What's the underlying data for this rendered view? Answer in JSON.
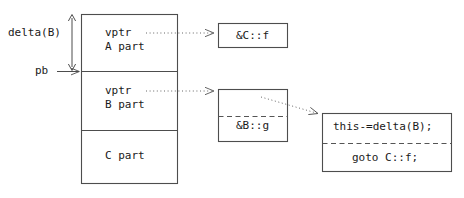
{
  "figure": {
    "type": "object-layout-vtable-diagram",
    "title": "",
    "background": "#ffffff",
    "stroke": "#4d4d4d",
    "text_color": "#1a1a1a"
  },
  "annotations": {
    "delta_label": "delta(B)",
    "pb_label": "pb"
  },
  "object_box": {
    "x": 81,
    "y": 14,
    "width": 97,
    "height": 170,
    "sections": [
      {
        "id": "a-part",
        "vptr_label": "vptr",
        "part_label": "A part",
        "y": 14,
        "height": 57
      },
      {
        "id": "b-part",
        "vptr_label": "vptr",
        "part_label": "B part",
        "y": 71,
        "height": 59
      },
      {
        "id": "c-part",
        "vptr_label": "",
        "part_label": "C part",
        "y": 130,
        "height": 54
      }
    ]
  },
  "vtable_entries": [
    {
      "id": "c-f",
      "label": "&C::f",
      "x": 218,
      "y": 23,
      "width": 70,
      "height": 25
    },
    {
      "id": "b-g",
      "label": "&B::g",
      "x": 218,
      "y": 89,
      "width": 70,
      "height": 53
    }
  ],
  "thunk_box": {
    "x": 322,
    "y": 113,
    "width": 130,
    "height": 59,
    "line1": "this-=delta(B);",
    "line2": "goto C::f;"
  },
  "arrows": [
    {
      "id": "delta-span",
      "kind": "double-headed-vertical",
      "x": 72,
      "y1": 14,
      "y2": 71
    },
    {
      "id": "pb-pointer",
      "kind": "solid-right",
      "x1": 57,
      "x2": 81,
      "y": 71
    },
    {
      "id": "a-vptr-to-cf",
      "kind": "dotted-right",
      "x1": 145,
      "x2": 216,
      "y": 33
    },
    {
      "id": "b-vptr-to-bg",
      "kind": "dotted-right",
      "x1": 145,
      "x2": 216,
      "y": 91
    },
    {
      "id": "bg-to-thunk",
      "kind": "dotted-diagonal",
      "x1": 261,
      "y1": 97,
      "x2": 320,
      "y2": 114
    }
  ]
}
